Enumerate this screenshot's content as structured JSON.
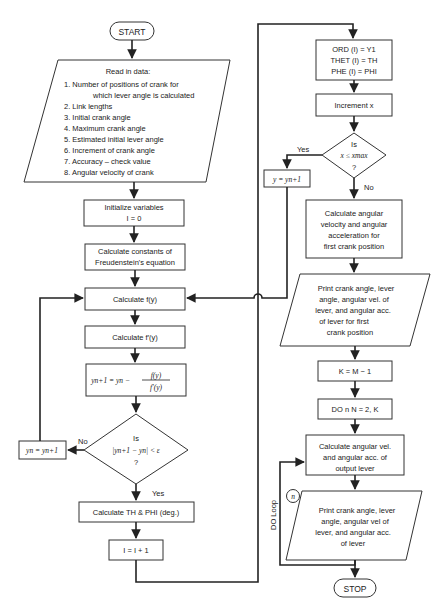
{
  "start": "START",
  "stop": "STOP",
  "read_data": {
    "title": "Read in data:",
    "items": [
      "1. Number of positions of crank for",
      "which lever angle is calculated",
      "2. Link lengths",
      "3. Initial crank angle",
      "4. Maximum crank angle",
      "5. Estimated initial lever angle",
      "6. Increment of crank angle",
      "7. Accuracy – check value",
      "8. Angular velocity of crank"
    ]
  },
  "init": {
    "line1": "Initialize variables",
    "line2": "I = 0"
  },
  "constants": {
    "line1": "Calculate constants of",
    "line2": "Freudenstein's equation"
  },
  "calc_f": "Calculate f(y)",
  "calc_fprime": "Calculate f′(y)",
  "newton": {
    "lhs": "yn+1 = yn −",
    "num": "f(y)",
    "den": "f′(y)"
  },
  "convergence": {
    "line1": "Is",
    "line2": "|yn+1 − yn| < ε",
    "line3": "?",
    "no": "No",
    "yes": "Yes"
  },
  "update_y": "yn = yn+1",
  "calc_th_phi": "Calculate TH & PHI (deg.)",
  "increment_i": "I = I + 1",
  "store": {
    "line1": "ORD (I) = Y1",
    "line2": "THET (I) = TH",
    "line3": "PHE (I) = PHI"
  },
  "increment_x": "Increment x",
  "x_check": {
    "line1": "Is",
    "line2": "x ≤ xmax",
    "line3": "?",
    "yes": "Yes",
    "no": "No"
  },
  "set_y": "y = yn+1",
  "calc_first": [
    "Calculate angular",
    "velocity and angular",
    "acceleration for",
    "first crank position"
  ],
  "print_first": [
    "Print crank angle, lever",
    "angle, angular vel. of",
    "lever, and angular acc.",
    "of lever for first",
    "crank position"
  ],
  "k_assign": "K = M − 1",
  "do_loop_start": "DO n N = 2, K",
  "calc_output": [
    "Calculate angular vel.",
    "and angular acc. of",
    "output lever"
  ],
  "print_loop": [
    "Print crank angle, lever",
    "angle, angular vel of",
    "lever, and angular acc.",
    "of lever"
  ],
  "loop_connector": "n",
  "do_loop_label": "DO Loop"
}
